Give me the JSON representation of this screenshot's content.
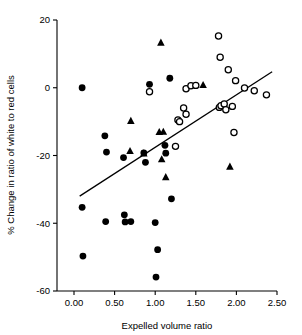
{
  "chart_data": {
    "type": "scatter",
    "title": "",
    "xlabel": "Expelled volume ratio",
    "ylabel": "% Change in ratio of white to red cells",
    "xlim": [
      0.0,
      2.5
    ],
    "ylim": [
      -60,
      20
    ],
    "xticks": [
      "0.00",
      "0.50",
      "1.00",
      "1.50",
      "2.00",
      "2.50"
    ],
    "xtick_values": [
      0.0,
      0.5,
      1.0,
      1.5,
      2.0,
      2.5
    ],
    "yticks": [
      "20",
      "0",
      "-20",
      "-40",
      "-60"
    ],
    "ytick_values": [
      20,
      0,
      -20,
      -40,
      -60
    ],
    "grid": false,
    "legend_position": "none",
    "series": [
      {
        "name": "filled-circle",
        "marker": "filled-circle",
        "color": "#000000",
        "points": [
          [
            0.1,
            0.0
          ],
          [
            0.1,
            -35.3
          ],
          [
            0.11,
            -49.7
          ],
          [
            0.38,
            -14.2
          ],
          [
            0.39,
            -39.5
          ],
          [
            0.4,
            -19.0
          ],
          [
            0.61,
            -20.6
          ],
          [
            0.62,
            -37.5
          ],
          [
            0.63,
            -39.6
          ],
          [
            0.7,
            -39.5
          ],
          [
            0.86,
            -19.2
          ],
          [
            0.88,
            -22.0
          ],
          [
            0.93,
            1.0
          ],
          [
            1.0,
            -39.8
          ],
          [
            1.01,
            -55.9
          ],
          [
            1.03,
            -47.8
          ],
          [
            1.12,
            -17.0
          ],
          [
            1.13,
            -19.3
          ],
          [
            1.18,
            2.8
          ],
          [
            1.2,
            -32.8
          ]
        ]
      },
      {
        "name": "filled-triangle",
        "marker": "filled-triangle",
        "color": "#000000",
        "points": [
          [
            1.07,
            13.3
          ],
          [
            0.7,
            -9.8
          ],
          [
            0.69,
            -18.7
          ],
          [
            0.86,
            -19.4
          ],
          [
            1.05,
            -13.1
          ],
          [
            1.1,
            -13.0
          ],
          [
            1.08,
            -21.1
          ],
          [
            1.13,
            -26.4
          ],
          [
            1.59,
            0.8
          ],
          [
            1.92,
            -23.3
          ]
        ]
      },
      {
        "name": "open-circle",
        "marker": "open-circle",
        "color": "#000000",
        "points": [
          [
            0.93,
            -1.2
          ],
          [
            1.25,
            -17.3
          ],
          [
            1.28,
            -9.5
          ],
          [
            1.3,
            -10.0
          ],
          [
            1.35,
            -6.0
          ],
          [
            1.38,
            -7.8
          ],
          [
            1.38,
            -0.3
          ],
          [
            1.44,
            0.6
          ],
          [
            1.5,
            0.7
          ],
          [
            1.78,
            15.3
          ],
          [
            1.79,
            -5.8
          ],
          [
            1.81,
            -5.3
          ],
          [
            1.8,
            9.0
          ],
          [
            1.85,
            -4.8
          ],
          [
            1.87,
            -6.5
          ],
          [
            1.9,
            5.3
          ],
          [
            1.95,
            -5.5
          ],
          [
            1.99,
            2.1
          ],
          [
            1.97,
            -13.2
          ],
          [
            2.1,
            -0.1
          ],
          [
            2.22,
            -0.9
          ],
          [
            2.37,
            -2.1
          ]
        ]
      }
    ],
    "trendline": {
      "x_start": 0.07,
      "y_start": -32.0,
      "x_end": 2.44,
      "y_end": 4.7,
      "color": "#000000"
    }
  }
}
